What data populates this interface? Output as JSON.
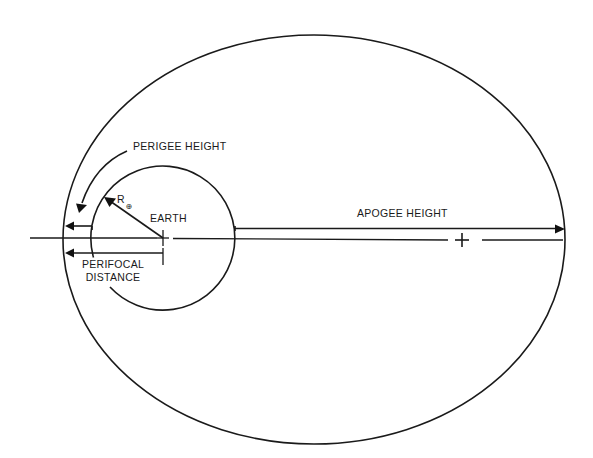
{
  "diagram": {
    "labels": {
      "perigee_height": "PERIGEE HEIGHT",
      "apogee_height": "APOGEE HEIGHT",
      "earth": "EARTH",
      "earth_radius_symbol": "R",
      "earth_radius_subscript": "⊕",
      "perifocal_line1": "PERIFOCAL",
      "perifocal_line2": "DISTANCE"
    },
    "geometry": {
      "orbit_ellipse": {
        "cx": 314,
        "cy": 239.5,
        "rx": 251,
        "ry": 204.5
      },
      "earth_circle": {
        "cx": 163,
        "cy": 238,
        "r": 72
      },
      "major_axis_y": 238,
      "earth_center_focus": {
        "x": 163,
        "y": 238
      },
      "empty_focus": {
        "x": 462,
        "y": 240
      }
    },
    "colors": {
      "ink": "#1a1a1a",
      "background": "#ffffff"
    }
  }
}
